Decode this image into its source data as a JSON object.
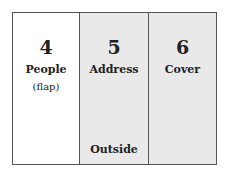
{
  "panels": [
    {
      "number": "4",
      "label": "People",
      "sub": "(flap)",
      "bottom": ""
    },
    {
      "number": "5",
      "label": "Address",
      "sub": "",
      "bottom": "Outside"
    },
    {
      "number": "6",
      "label": "Cover",
      "sub": "",
      "bottom": ""
    }
  ],
  "colors": {
    "white_panel": "#ffffff",
    "shaded_panel": "#e9e9e9",
    "border": "#555555"
  }
}
